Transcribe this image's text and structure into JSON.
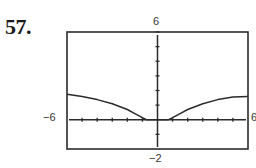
{
  "problem": {
    "number": "57."
  },
  "window": {
    "xmin_label": "−6",
    "xmax_label": "6",
    "ymin_label": "−2",
    "ymax_label": "6"
  },
  "colors": {
    "frame": "#2b2b2b",
    "axis": "#2b2b2b",
    "curve": "#2b2b2b",
    "text": "#3a3a3a"
  },
  "chart_data": {
    "type": "line",
    "title": "",
    "xlabel": "",
    "ylabel": "",
    "xlim": [
      -6,
      6
    ],
    "ylim": [
      -2,
      6
    ],
    "xticks_step": 1,
    "yticks_step": 1,
    "grid": false,
    "tick_labels": {
      "xmin": "−6",
      "xmax": "6",
      "ymin": "−2",
      "ymax": "6"
    },
    "series": [
      {
        "name": "curve",
        "x": [
          -6,
          -5,
          -4,
          -3,
          -2,
          -1.5,
          -1,
          -0.7,
          0,
          0.7,
          1,
          1.5,
          2,
          3,
          4,
          5,
          6
        ],
        "y": [
          1.75,
          1.6,
          1.38,
          1.1,
          0.7,
          0.42,
          0.15,
          0,
          0,
          0,
          0.15,
          0.42,
          0.7,
          1.1,
          1.38,
          1.55,
          1.6
        ]
      }
    ]
  }
}
